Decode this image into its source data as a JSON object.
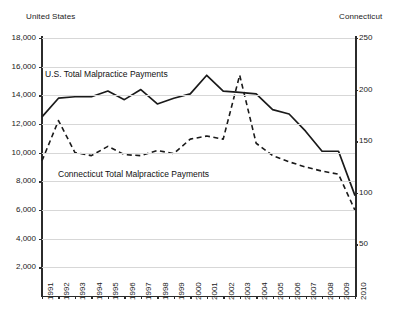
{
  "chart_data": {
    "type": "line",
    "title": "",
    "subtitle": "",
    "xlabel": "",
    "ylabel": "United States",
    "y2label": "Connecticut",
    "grid": true,
    "legend_position": "inline-annotations",
    "x": [
      1991,
      1992,
      1993,
      1994,
      1995,
      1996,
      1997,
      1998,
      1999,
      2000,
      2001,
      2002,
      2003,
      2004,
      2005,
      2006,
      2007,
      2008,
      2009,
      2010
    ],
    "xticklabels": [
      "1991",
      "1992",
      "1993",
      "1994",
      "1995",
      "1996",
      "1997",
      "1998",
      "1999",
      "2000",
      "2001",
      "2002",
      "2003",
      "2004",
      "2005",
      "2006",
      "2007",
      "2008",
      "2009",
      "2010"
    ],
    "ylim": [
      0,
      18000
    ],
    "yticks": [
      2000,
      4000,
      6000,
      8000,
      10000,
      12000,
      14000,
      16000,
      18000
    ],
    "yticklabels": [
      "2,000",
      "4,000",
      "6,000",
      "8,000",
      "10,000",
      "12,000",
      "14,000",
      "16,000",
      "18,000"
    ],
    "y2lim": [
      0,
      250
    ],
    "y2ticks": [
      50,
      100,
      150,
      200,
      250
    ],
    "y2ticklabels": [
      "50",
      "100",
      "150",
      "200",
      "250"
    ],
    "series": [
      {
        "name": "U.S. Total Malpractice Payments",
        "axis": "left",
        "style": "solid",
        "color": "#1a1a1a",
        "values": [
          12500,
          13800,
          13900,
          13900,
          14300,
          13700,
          14400,
          13400,
          13800,
          14100,
          15400,
          14300,
          14200,
          14100,
          13000,
          12700,
          11500,
          10100,
          10100,
          7000
        ]
      },
      {
        "name": "Connecticut Total Malpractice Payments",
        "axis": "right",
        "style": "dashed",
        "color": "#1a1a1a",
        "values": [
          131,
          170,
          139,
          136,
          145,
          137,
          136,
          141,
          138,
          152,
          155,
          152,
          214,
          148,
          136,
          130,
          125,
          121,
          118,
          83
        ]
      }
    ],
    "annotations": [
      {
        "text": "U.S. Total Malpractice Payments",
        "x": 1991.2,
        "y": 16000
      },
      {
        "text": "Connecticut Total Malpractice Payments",
        "x": 1992.0,
        "y": 8900
      }
    ]
  },
  "axes": {
    "left_title": "United States",
    "right_title": "Connecticut"
  }
}
